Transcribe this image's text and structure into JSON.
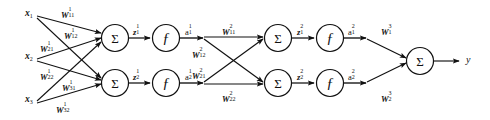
{
  "diagram": {
    "stroke_color": "#111111",
    "background_color": "#ffffff",
    "node_sum_glyph": "Σ",
    "node_fn_glyph": "ƒ",
    "inputs": [
      {
        "base": "x",
        "sub": "1"
      },
      {
        "base": "x",
        "sub": "2"
      },
      {
        "base": "x",
        "sub": "3"
      }
    ],
    "layer1_weights": [
      {
        "base": "W",
        "sub": "11",
        "sup": "1"
      },
      {
        "base": "W",
        "sub": "12",
        "sup": "1"
      },
      {
        "base": "W",
        "sub": "21",
        "sup": "1"
      },
      {
        "base": "W",
        "sub": "22",
        "sup": "1"
      },
      {
        "base": "W",
        "sub": "31",
        "sup": "1"
      },
      {
        "base": "W",
        "sub": "32",
        "sup": "1"
      }
    ],
    "layer1_pre": [
      {
        "base": "z",
        "sub": "1",
        "sup": "1"
      },
      {
        "base": "z",
        "sub": "2",
        "sup": "1"
      }
    ],
    "layer1_act": [
      {
        "base": "a",
        "sub": "1",
        "sup": "1"
      },
      {
        "base": "a",
        "sub": "2",
        "sup": "1"
      }
    ],
    "layer2_weights": [
      {
        "base": "W",
        "sub": "11",
        "sup": "2"
      },
      {
        "base": "W",
        "sub": "12",
        "sup": "2"
      },
      {
        "base": "W",
        "sub": "21",
        "sup": "2"
      },
      {
        "base": "W",
        "sub": "22",
        "sup": "2"
      }
    ],
    "layer2_pre": [
      {
        "base": "z",
        "sub": "1",
        "sup": "2"
      },
      {
        "base": "z",
        "sub": "2",
        "sup": "2"
      }
    ],
    "layer2_act": [
      {
        "base": "a",
        "sub": "1",
        "sup": "2"
      },
      {
        "base": "a",
        "sub": "2",
        "sup": "2"
      }
    ],
    "layer3_weights": [
      {
        "base": "W",
        "sub": "1",
        "sup": "3"
      },
      {
        "base": "W",
        "sub": "2",
        "sup": "3"
      }
    ],
    "output": {
      "base": "y",
      "sub": "",
      "sup": ""
    }
  }
}
